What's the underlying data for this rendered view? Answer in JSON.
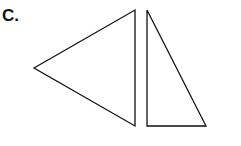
{
  "label": "C.",
  "colors": {
    "stroke": "#111111",
    "background": "#ffffff"
  },
  "shapes": [
    {
      "name": "triangle-left",
      "points": "34,68 135,10 135,126"
    },
    {
      "name": "triangle-right",
      "points": "147,10 147,126 206,126"
    }
  ]
}
